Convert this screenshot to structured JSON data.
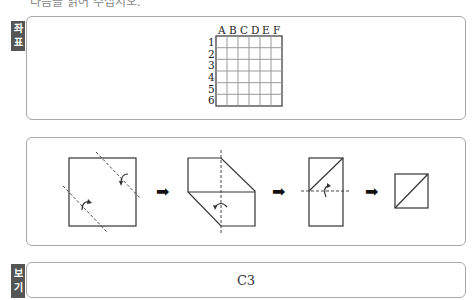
{
  "header": {
    "partial_text": "다음을 읽어 주십시오."
  },
  "coordinate_panel": {
    "tag": [
      "좌",
      "표"
    ],
    "column_labels": [
      "A",
      "B",
      "C",
      "D",
      "E",
      "F"
    ],
    "row_labels": [
      "1",
      "2",
      "3",
      "4",
      "5",
      "6"
    ],
    "grid": {
      "rows": 6,
      "cols": 6
    }
  },
  "folding_panel": {
    "steps": [
      {
        "shape": "square",
        "folds": "two diagonal dashed fold lines with curved arrows"
      },
      {
        "shape": "hexagon",
        "folds": "vertical dashed fold line with curved arrow"
      },
      {
        "shape": "rectangle-with-diagonal",
        "folds": "horizontal dashed fold line with curved arrow"
      },
      {
        "shape": "square-with-diagonal",
        "folds": "none"
      }
    ],
    "arrow_glyph": "➡"
  },
  "answer_panel": {
    "tag": [
      "보",
      "기"
    ],
    "value": "C3"
  },
  "colors": {
    "tag_bg": "#555555",
    "border": "#a8a8a8",
    "line": "#333333"
  }
}
